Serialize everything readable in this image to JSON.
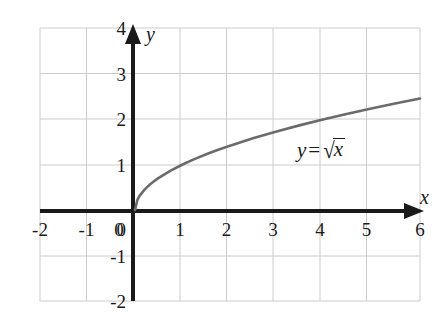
{
  "chart_data": {
    "type": "line",
    "title": "",
    "subtitle": "",
    "xlabel": "x",
    "ylabel": "y",
    "xlim": [
      -2,
      6
    ],
    "ylim": [
      -2,
      4
    ],
    "xticks": [
      "-2",
      "-1",
      "0",
      "1",
      "2",
      "3",
      "4",
      "5",
      "6"
    ],
    "xtick_values": [
      -2,
      -1,
      0,
      1,
      2,
      3,
      4,
      5,
      6
    ],
    "yticks": [
      "4",
      "3",
      "2",
      "1",
      "0",
      "-1",
      "-2"
    ],
    "ytick_values": [
      4,
      3,
      2,
      1,
      0,
      -1,
      -2
    ],
    "grid": true,
    "grid_spacing_x": 1,
    "grid_spacing_y": 1,
    "legend": "none",
    "annotations": [
      {
        "text": "y = √x",
        "lhs": "y",
        "operator": "=",
        "radical_symbol": "√",
        "radicand": "x",
        "x": 4.0,
        "y": 1.35
      }
    ],
    "series": [
      {
        "name": "y = √x",
        "color": "#6b6b6b",
        "domain": [
          0,
          6
        ],
        "x": [
          0,
          0.05,
          0.1,
          0.2,
          0.3,
          0.4,
          0.5,
          0.75,
          1,
          1.25,
          1.5,
          1.75,
          2,
          2.5,
          3,
          3.5,
          4,
          4.5,
          5,
          5.5,
          6
        ],
        "values": [
          0,
          0.224,
          0.316,
          0.447,
          0.548,
          0.632,
          0.707,
          0.866,
          1,
          1.118,
          1.225,
          1.323,
          1.414,
          1.581,
          1.732,
          1.871,
          2,
          2.121,
          2.236,
          2.345,
          2.449
        ]
      }
    ],
    "colors": {
      "curve": "#6b6b6b",
      "axis": "#1a1a1a",
      "grid": "#cccccc",
      "frame": "#cccccc",
      "background": "#ffffff",
      "text": "#1a1a1a"
    }
  }
}
